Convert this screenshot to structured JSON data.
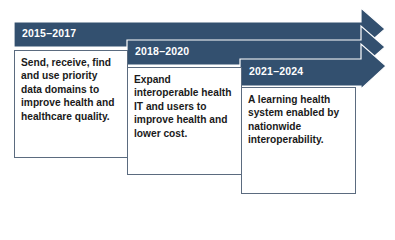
{
  "colors": {
    "arrow": "#33506f",
    "arrow_edge": "#ffffff",
    "box_border": "#5b6b7f"
  },
  "phases": [
    {
      "period": "2015–2017",
      "description": "Send, receive, find and use priority data domains to improve health and healthcare quality."
    },
    {
      "period": "2018–2020",
      "description": "Expand interoperable health IT and users to improve health and lower cost."
    },
    {
      "period": "2021–2024",
      "description": "A learning health system enabled by nationwide interoperability."
    }
  ]
}
